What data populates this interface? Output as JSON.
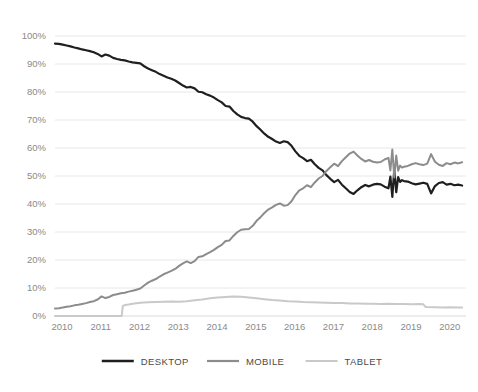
{
  "chart_data": {
    "type": "line",
    "title": "",
    "subtitle": "",
    "xlabel": "",
    "ylabel": "",
    "xlim": [
      2010,
      2020.6
    ],
    "ylim": [
      0,
      100
    ],
    "grid": true,
    "legend_position": "bottom",
    "y_unit": "%",
    "x_tick_labels": [
      "2010",
      "2011",
      "2012",
      "2013",
      "2014",
      "2015",
      "2016",
      "2017",
      "2018",
      "2019",
      "2020"
    ],
    "x_ticks": [
      2010,
      2011,
      2012,
      2013,
      2014,
      2015,
      2016,
      2017,
      2018,
      2019,
      2020
    ],
    "y_tick_labels": [
      "0%",
      "10%",
      "20%",
      "30%",
      "40%",
      "50%",
      "60%",
      "70%",
      "80%",
      "90%",
      "100%"
    ],
    "y_ticks": [
      0,
      10,
      20,
      30,
      40,
      50,
      60,
      70,
      80,
      90,
      100
    ],
    "series": [
      {
        "name": "DESKTOP",
        "color": "#1f1f1f",
        "width": 2.2,
        "x": [
          2010.0,
          2010.1,
          2010.2,
          2010.3,
          2010.4,
          2010.5,
          2010.6,
          2010.7,
          2010.8,
          2010.9,
          2011.0,
          2011.1,
          2011.2,
          2011.3,
          2011.4,
          2011.5,
          2011.6,
          2011.7,
          2011.8,
          2011.9,
          2012.0,
          2012.1,
          2012.2,
          2012.3,
          2012.4,
          2012.5,
          2012.6,
          2012.7,
          2012.8,
          2012.9,
          2013.0,
          2013.1,
          2013.2,
          2013.3,
          2013.4,
          2013.5,
          2013.6,
          2013.7,
          2013.8,
          2013.9,
          2014.0,
          2014.1,
          2014.2,
          2014.3,
          2014.4,
          2014.5,
          2014.6,
          2014.7,
          2014.8,
          2014.9,
          2015.0,
          2015.1,
          2015.2,
          2015.3,
          2015.4,
          2015.5,
          2015.6,
          2015.7,
          2015.8,
          2015.9,
          2016.0,
          2016.1,
          2016.2,
          2016.3,
          2016.4,
          2016.5,
          2016.6,
          2016.7,
          2016.8,
          2016.9,
          2017.0,
          2017.1,
          2017.2,
          2017.3,
          2017.4,
          2017.5,
          2017.6,
          2017.7,
          2017.8,
          2017.9,
          2018.0,
          2018.1,
          2018.2,
          2018.3,
          2018.4,
          2018.5,
          2018.6,
          2018.65,
          2018.7,
          2018.75,
          2018.8,
          2018.85,
          2018.9,
          2018.95,
          2019.0,
          2019.1,
          2019.2,
          2019.3,
          2019.4,
          2019.5,
          2019.6,
          2019.7,
          2019.8,
          2019.9,
          2020.0,
          2020.1,
          2020.2,
          2020.3,
          2020.4,
          2020.5
        ],
        "y": [
          97.3,
          97.2,
          96.9,
          96.6,
          96.3,
          95.9,
          95.6,
          95.2,
          94.9,
          94.6,
          94.2,
          93.6,
          92.7,
          93.4,
          93.0,
          92.2,
          91.8,
          91.5,
          91.3,
          90.9,
          90.6,
          90.4,
          90.2,
          89.2,
          88.4,
          87.8,
          87.2,
          86.4,
          85.8,
          85.2,
          84.7,
          84.1,
          83.2,
          82.3,
          81.6,
          81.8,
          81.3,
          80.1,
          79.9,
          79.2,
          78.7,
          78.0,
          77.1,
          76.3,
          75.0,
          74.8,
          73.2,
          72.0,
          71.1,
          70.7,
          70.5,
          69.4,
          67.8,
          66.5,
          65.1,
          64.0,
          63.2,
          62.3,
          61.8,
          62.4,
          62.1,
          60.8,
          58.8,
          57.2,
          56.4,
          55.3,
          55.8,
          54.2,
          52.9,
          52.0,
          50.3,
          49.0,
          47.8,
          48.6,
          46.9,
          45.6,
          44.3,
          43.6,
          44.9,
          46.0,
          46.8,
          46.3,
          46.9,
          47.2,
          47.0,
          46.2,
          45.6,
          49.8,
          42.5,
          52.3,
          44.2,
          49.6,
          47.9,
          48.5,
          48.2,
          48.0,
          47.4,
          47.0,
          47.3,
          47.6,
          47.2,
          43.8,
          46.4,
          47.5,
          47.8,
          46.9,
          47.2,
          46.7,
          46.9,
          46.6
        ]
      },
      {
        "name": "MOBILE",
        "color": "#8c8c8c",
        "width": 2.0,
        "x": [
          2010.0,
          2010.1,
          2010.2,
          2010.3,
          2010.4,
          2010.5,
          2010.6,
          2010.7,
          2010.8,
          2010.9,
          2011.0,
          2011.1,
          2011.2,
          2011.3,
          2011.4,
          2011.5,
          2011.6,
          2011.7,
          2011.8,
          2011.9,
          2012.0,
          2012.1,
          2012.2,
          2012.3,
          2012.4,
          2012.5,
          2012.6,
          2012.7,
          2012.8,
          2012.9,
          2013.0,
          2013.1,
          2013.2,
          2013.3,
          2013.4,
          2013.5,
          2013.6,
          2013.7,
          2013.8,
          2013.9,
          2014.0,
          2014.1,
          2014.2,
          2014.3,
          2014.4,
          2014.5,
          2014.6,
          2014.7,
          2014.8,
          2014.9,
          2015.0,
          2015.1,
          2015.2,
          2015.3,
          2015.4,
          2015.5,
          2015.6,
          2015.7,
          2015.8,
          2015.9,
          2016.0,
          2016.1,
          2016.2,
          2016.3,
          2016.4,
          2016.5,
          2016.6,
          2016.7,
          2016.8,
          2016.9,
          2017.0,
          2017.1,
          2017.2,
          2017.3,
          2017.4,
          2017.5,
          2017.6,
          2017.7,
          2017.8,
          2017.9,
          2018.0,
          2018.1,
          2018.2,
          2018.3,
          2018.4,
          2018.5,
          2018.6,
          2018.65,
          2018.7,
          2018.75,
          2018.8,
          2018.85,
          2018.9,
          2018.95,
          2019.0,
          2019.1,
          2019.2,
          2019.3,
          2019.4,
          2019.5,
          2019.6,
          2019.7,
          2019.8,
          2019.9,
          2020.0,
          2020.1,
          2020.2,
          2020.3,
          2020.4,
          2020.5
        ],
        "y": [
          2.7,
          2.8,
          3.0,
          3.3,
          3.5,
          3.8,
          4.0,
          4.3,
          4.6,
          5.0,
          5.3,
          5.9,
          7.0,
          6.4,
          6.8,
          7.5,
          7.8,
          8.1,
          8.3,
          8.7,
          9.0,
          9.4,
          9.8,
          10.9,
          11.9,
          12.6,
          13.2,
          14.1,
          14.9,
          15.5,
          16.1,
          16.8,
          17.9,
          18.8,
          19.5,
          18.9,
          19.6,
          21.1,
          21.3,
          22.1,
          22.8,
          23.6,
          24.6,
          25.4,
          26.8,
          27.0,
          28.6,
          29.9,
          30.8,
          31.0,
          31.1,
          32.2,
          34.0,
          35.3,
          36.8,
          38.0,
          38.8,
          39.7,
          40.2,
          39.4,
          39.6,
          41.0,
          43.2,
          44.9,
          45.6,
          46.7,
          46.0,
          47.7,
          49.1,
          50.0,
          51.8,
          53.1,
          54.4,
          53.5,
          55.3,
          56.7,
          58.0,
          58.7,
          57.3,
          56.1,
          55.2,
          55.7,
          55.1,
          54.8,
          55.0,
          55.9,
          56.5,
          52.0,
          59.5,
          49.5,
          57.3,
          51.9,
          53.7,
          53.0,
          53.3,
          53.6,
          54.2,
          54.6,
          54.2,
          53.9,
          54.4,
          57.8,
          55.1,
          54.0,
          53.6,
          54.6,
          54.2,
          54.8,
          54.5,
          54.9
        ]
      },
      {
        "name": "TABLET",
        "color": "#c9c9c9",
        "width": 2.0,
        "x": [
          2010.0,
          2010.3,
          2010.6,
          2010.9,
          2011.2,
          2011.5,
          2011.72,
          2011.75,
          2011.8,
          2011.9,
          2012.0,
          2012.2,
          2012.4,
          2012.6,
          2012.8,
          2013.0,
          2013.2,
          2013.4,
          2013.6,
          2013.8,
          2014.0,
          2014.2,
          2014.4,
          2014.6,
          2014.8,
          2015.0,
          2015.2,
          2015.4,
          2015.6,
          2015.8,
          2016.0,
          2016.2,
          2016.4,
          2016.6,
          2016.8,
          2017.0,
          2017.2,
          2017.4,
          2017.6,
          2017.8,
          2018.0,
          2018.2,
          2018.4,
          2018.6,
          2018.8,
          2019.0,
          2019.2,
          2019.4,
          2019.5,
          2019.55,
          2019.6,
          2019.8,
          2020.0,
          2020.2,
          2020.4,
          2020.5
        ],
        "y": [
          0.0,
          0.0,
          0.0,
          0.0,
          0.0,
          0.0,
          0.0,
          3.6,
          3.9,
          4.1,
          4.4,
          4.7,
          4.9,
          5.0,
          5.1,
          5.2,
          5.1,
          5.3,
          5.6,
          5.9,
          6.3,
          6.6,
          6.8,
          7.0,
          6.9,
          6.6,
          6.3,
          6.0,
          5.7,
          5.5,
          5.3,
          5.2,
          5.0,
          4.9,
          4.8,
          4.7,
          4.6,
          4.6,
          4.5,
          4.5,
          4.4,
          4.4,
          4.3,
          4.4,
          4.3,
          4.3,
          4.2,
          4.3,
          4.2,
          3.3,
          3.2,
          3.1,
          3.0,
          3.1,
          3.0,
          3.0
        ]
      }
    ]
  },
  "legend": {
    "items": [
      {
        "label": "DESKTOP",
        "color": "#1f1f1f",
        "width": 2.6
      },
      {
        "label": "MOBILE",
        "color": "#8c8c8c",
        "width": 2.2
      },
      {
        "label": "TABLET",
        "color": "#c9c9c9",
        "width": 2.2
      }
    ]
  },
  "colors": {
    "background": "#ffffff",
    "gridline": "#e8e8e8",
    "tick_text": "#8a8a8a",
    "legend_text": "#4a4a4a",
    "desktop": "#1f1f1f",
    "mobile": "#8c8c8c",
    "tablet": "#c9c9c9"
  }
}
